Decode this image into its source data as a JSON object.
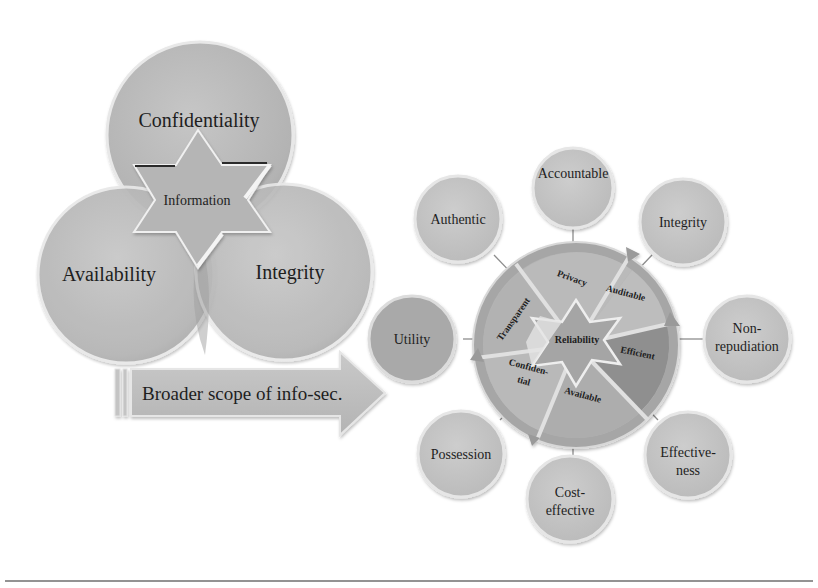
{
  "venn": {
    "circles": [
      {
        "label": "Confidentiality"
      },
      {
        "label": "Availability"
      },
      {
        "label": "Integrity"
      }
    ],
    "center_label": "Information"
  },
  "arrow": {
    "label": "Broader scope of info-sec."
  },
  "wheel": {
    "center_label": "Reliability",
    "segments": [
      {
        "label": "Privacy"
      },
      {
        "label": "Auditable"
      },
      {
        "label": "Efficient"
      },
      {
        "label": "Available"
      },
      {
        "label_line1": "Confiden-",
        "label_line2": "tial"
      },
      {
        "label": "Transparent"
      }
    ]
  },
  "satellites": [
    {
      "label_line1": "Accountable",
      "label_line2": ""
    },
    {
      "label_line1": "Integrity",
      "label_line2": ""
    },
    {
      "label_line1": "Non-",
      "label_line2": "repudiation"
    },
    {
      "label_line1": "Effective-",
      "label_line2": "ness"
    },
    {
      "label_line1": "Cost-",
      "label_line2": "effective"
    },
    {
      "label_line1": "Possession",
      "label_line2": ""
    },
    {
      "label_line1": "Utility",
      "label_line2": ""
    },
    {
      "label_line1": "Authentic",
      "label_line2": ""
    }
  ],
  "colors": {
    "circle_fill": "#b9b9b9",
    "circle_edge": "#e6e6e6",
    "dark_segment": "#8e8e8e",
    "text": "#1e1e1e",
    "rule": "#6f6f6f"
  }
}
